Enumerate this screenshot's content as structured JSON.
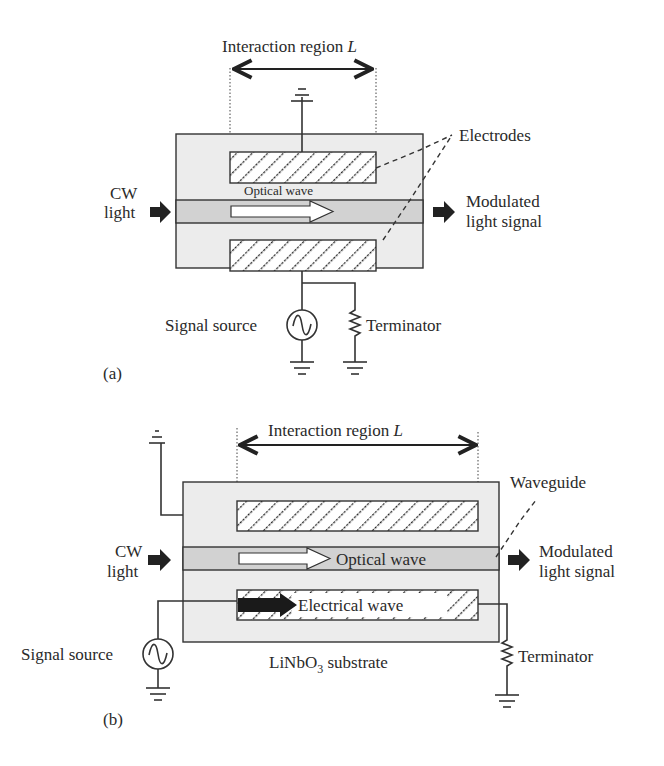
{
  "figure_a": {
    "panel_label": "(a)",
    "interaction_region": "Interaction region ",
    "interaction_symbol": "L",
    "electrodes_label": "Electrodes",
    "optical_wave_label": "Optical wave",
    "cw_light_line1": "CW",
    "cw_light_line2": "light",
    "modulated_line1": "Modulated",
    "modulated_line2": "light signal",
    "signal_source_label": "Signal source",
    "terminator_label": "Terminator"
  },
  "figure_b": {
    "panel_label": "(b)",
    "interaction_region": "Interaction region ",
    "interaction_symbol": "L",
    "waveguide_label": "Waveguide",
    "optical_wave_label": "Optical wave",
    "electrical_wave_label": "Electrical wave",
    "cw_light_line1": "CW",
    "cw_light_line2": "light",
    "modulated_line1": "Modulated",
    "modulated_line2": "light signal",
    "signal_source_label": "Signal source",
    "terminator_label": "Terminator",
    "substrate_main": "LiNbO",
    "substrate_sub": "3",
    "substrate_suffix": " substrate"
  },
  "colors": {
    "substrate": "#ececec",
    "waveguide": "#d2d2d2",
    "line": "#333333"
  }
}
